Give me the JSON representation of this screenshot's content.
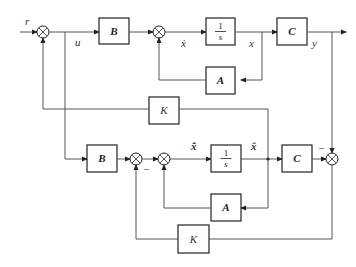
{
  "diagram": {
    "type": "block-diagram",
    "signals": {
      "r": "r",
      "u": "u",
      "x_dot": "ẋ",
      "x": "x",
      "y": "y",
      "xhat_dot": "x̂̇",
      "xhat": "x̂"
    },
    "blocks": {
      "B_top": "B",
      "integrator_top_num": "1",
      "integrator_top_den": "s",
      "C_top": "C",
      "A_top": "A",
      "K_top": "K",
      "B_bot": "B",
      "integrator_bot_num": "1",
      "integrator_bot_den": "s",
      "C_bot": "C",
      "A_bot": "A",
      "K_bot": "K"
    },
    "signs": {
      "minus_obs": "−",
      "minus_out": "−"
    }
  }
}
